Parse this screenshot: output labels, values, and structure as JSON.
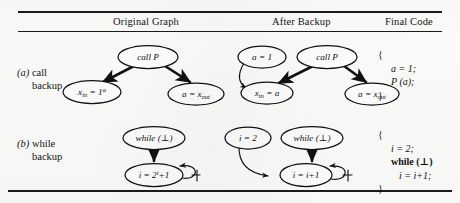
{
  "figure": {
    "caption_rows": [
      {
        "tag": "(a)",
        "line1": "call",
        "line2": "backup"
      },
      {
        "tag": "(b)",
        "line1": "while",
        "line2": "backup"
      }
    ],
    "columns": {
      "original_graph": "Original Graph",
      "after_backup": "After Backup",
      "final_code": "Final Code"
    }
  },
  "row_a": {
    "original_graph": {
      "nodes": [
        {
          "id": "call-p",
          "label": "call P",
          "x": 148,
          "y": 57,
          "rx": 30,
          "ry": 11.5
        },
        {
          "id": "x-in-assign",
          "label": "x_in = 1^a",
          "x": 92,
          "y": 92,
          "rx": 29,
          "ry": 11.5
        },
        {
          "id": "a-assign-x-out",
          "label": "a = x_out",
          "x": 196,
          "y": 94,
          "rx": 28,
          "ry": 11
        }
      ],
      "edges": [
        {
          "from": "call-p",
          "to": "x-in-assign",
          "style": "thick"
        },
        {
          "from": "call-p",
          "to": "a-assign-x-out",
          "style": "thick"
        }
      ]
    },
    "after_backup": {
      "nodes": [
        {
          "id": "a-eq-1",
          "label": "a = 1",
          "x": 262,
          "y": 57,
          "rx": 24,
          "ry": 11
        },
        {
          "id": "call-p2",
          "label": "call P",
          "x": 327,
          "y": 57,
          "rx": 30,
          "ry": 11.5
        },
        {
          "id": "x-in-eq-a",
          "label": "x_in = a",
          "x": 267,
          "y": 93,
          "rx": 26,
          "ry": 11
        },
        {
          "id": "a-eq-x-out",
          "label": "a = x_out",
          "x": 372,
          "y": 94,
          "rx": 27,
          "ry": 11
        }
      ],
      "edges": [
        {
          "from": "a-eq-1",
          "to": "x-in-eq-a",
          "style": "thin"
        },
        {
          "from": "call-p2",
          "to": "x-in-eq-a",
          "style": "thick"
        },
        {
          "from": "call-p2",
          "to": "a-eq-x-out",
          "style": "thick"
        }
      ]
    },
    "final_code": {
      "open_brace": "{",
      "lines": [
        "a = 1;",
        "P (a);"
      ],
      "close_brace": "}"
    }
  },
  "row_b": {
    "original_graph": {
      "nodes": [
        {
          "id": "while-bot",
          "label": "while (⊥)",
          "x": 154,
          "y": 138,
          "rx": 31,
          "ry": 11.5
        },
        {
          "id": "i-eq-2i1",
          "label": "i = 2^i +1",
          "x": 154,
          "y": 175,
          "rx": 29,
          "ry": 11.5
        }
      ],
      "edges": [
        {
          "from": "while-bot",
          "to": "i-eq-2i1",
          "style": "thick"
        },
        {
          "from": "i-eq-2i1",
          "to": "i-eq-2i1",
          "style": "self-loop"
        }
      ]
    },
    "after_backup": {
      "nodes": [
        {
          "id": "i-eq-2",
          "label": "i = 2",
          "x": 248,
          "y": 138,
          "rx": 23,
          "ry": 11
        },
        {
          "id": "while-bot2",
          "label": "while (⊥)",
          "x": 312,
          "y": 138,
          "rx": 31,
          "ry": 11.5
        },
        {
          "id": "i-eq-i1",
          "label": "i = i+1",
          "x": 306,
          "y": 175,
          "rx": 26,
          "ry": 11.5
        }
      ],
      "edges": [
        {
          "from": "i-eq-2",
          "to": "i-eq-i1",
          "style": "thin"
        },
        {
          "from": "while-bot2",
          "to": "i-eq-i1",
          "style": "thick"
        },
        {
          "from": "i-eq-i1",
          "to": "i-eq-i1",
          "style": "self-loop"
        }
      ]
    },
    "final_code": {
      "open_brace": "{",
      "lines": [
        "i = 2;",
        "while (⊥)",
        "i = i+1;"
      ],
      "close_brace": "}"
    }
  },
  "colors": {
    "ink": "#111111",
    "paper": "#fdfdfc"
  }
}
